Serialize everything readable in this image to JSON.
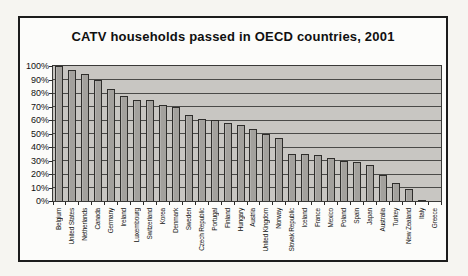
{
  "page": {
    "background": "#f6f5f1"
  },
  "chart_data": {
    "type": "bar",
    "title": "CATV households passed in OECD countries, 2001",
    "categories": [
      "Belgium",
      "United States",
      "Netherlands",
      "Canada",
      "Germany",
      "Ireland",
      "Luxembourg",
      "Switzerland",
      "Korea",
      "Denmark",
      "Sweden",
      "Czech Republic",
      "Portugal",
      "Finland",
      "Hungary",
      "Austria",
      "United Kingdom",
      "Norway",
      "Slovak Republic",
      "Iceland",
      "France",
      "Mexico",
      "Poland",
      "Spain",
      "Japan",
      "Australia",
      "Turkey",
      "New Zealand",
      "Italy",
      "Greece"
    ],
    "values": [
      100,
      97,
      94,
      90,
      83,
      78,
      75,
      75,
      71,
      70,
      64,
      61,
      60,
      58,
      56,
      53,
      50,
      47,
      35,
      35,
      34,
      32,
      30,
      29,
      27,
      19,
      13,
      9,
      1,
      0
    ],
    "unit": "%",
    "xlabel": "",
    "ylabel": "",
    "ylim": [
      0,
      100
    ],
    "y_ticks": [
      "100%",
      "90%",
      "80%",
      "70%",
      "60%",
      "50%",
      "40%",
      "30%",
      "20%",
      "10%",
      "0%"
    ],
    "grid": "horizontal",
    "legend": "none",
    "colors": {
      "plot_background": "#c8c6c2",
      "bar_fill": "#a3a19d",
      "bar_border": "#2e2d2b",
      "gridline": "#4a4a48",
      "axis": "#2a2a28",
      "text": "#111111",
      "frame_border": "#1c1c1c",
      "frame_background": "#fcfcfa"
    }
  }
}
